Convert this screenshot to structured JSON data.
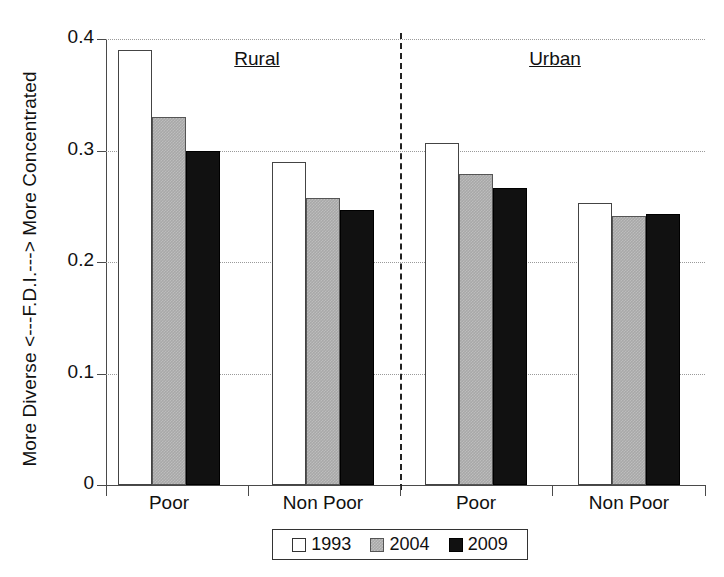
{
  "chart_data": {
    "type": "bar",
    "title": "",
    "xlabel": "",
    "ylabel": "More Diverse <---F.D.I.---> More Concentrated",
    "ylim": [
      0,
      0.4
    ],
    "ytick_labels": [
      "0",
      "0.1",
      "0.2",
      "0.3",
      "0.4"
    ],
    "ytick_values": [
      0,
      0.1,
      0.2,
      0.3,
      0.4
    ],
    "grid": true,
    "legend_position": "bottom-center",
    "panels": [
      "Rural",
      "Urban"
    ],
    "categories": [
      "Poor",
      "Non Poor",
      "Poor",
      "Non Poor"
    ],
    "series": [
      {
        "name": "1993",
        "color": "#ffffff",
        "values": [
          0.39,
          0.29,
          0.307,
          0.253
        ]
      },
      {
        "name": "2004",
        "color": "#a8a8a8",
        "values": [
          0.33,
          0.257,
          0.279,
          0.241
        ]
      },
      {
        "name": "2009",
        "color": "#111111",
        "values": [
          0.3,
          0.247,
          0.266,
          0.243
        ]
      }
    ],
    "annotations": [
      "Rural",
      "Urban"
    ],
    "divider": "dashed vertical line separating Rural and Urban panels"
  },
  "axis": {
    "y_title": "More Diverse <---F.D.I.---> More Concentrated",
    "ticks": [
      {
        "label": "0.4",
        "value": 0.4
      },
      {
        "label": "0.3",
        "value": 0.3
      },
      {
        "label": "0.2",
        "value": 0.2
      },
      {
        "label": "0.1",
        "value": 0.1
      },
      {
        "label": "0",
        "value": 0
      }
    ]
  },
  "groups": [
    {
      "header": "Rural",
      "categories": [
        "Poor",
        "Non Poor"
      ]
    },
    {
      "header": "Urban",
      "categories": [
        "Poor",
        "Non Poor"
      ]
    }
  ],
  "x_labels": [
    "Poor",
    "Non Poor",
    "Poor",
    "Non Poor"
  ],
  "legend": {
    "items": [
      {
        "label": "1993",
        "style": "c1993"
      },
      {
        "label": "2004",
        "style": "c2004"
      },
      {
        "label": "2009",
        "style": "c2009"
      }
    ]
  }
}
